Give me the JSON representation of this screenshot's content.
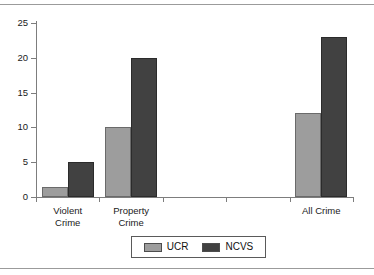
{
  "chart_data": {
    "type": "bar",
    "title": "",
    "subtitle": "",
    "xlabel": "",
    "ylabel": "",
    "ylim": [
      0,
      25
    ],
    "yticks": [
      0,
      5,
      10,
      15,
      20,
      25
    ],
    "grid": false,
    "legend_position": "bottom",
    "categories": [
      "Violent Crime",
      "Property Crime",
      "",
      "",
      "All Crime"
    ],
    "category_lines": [
      [
        "Violent",
        "Crime"
      ],
      [
        "Property",
        "Crime"
      ],
      [
        ""
      ],
      [
        ""
      ],
      [
        "All Crime"
      ]
    ],
    "series": [
      {
        "name": "UCR",
        "color": "#9d9d9d",
        "values": [
          1.5,
          10,
          null,
          null,
          12
        ]
      },
      {
        "name": "NCVS",
        "color": "#414141",
        "values": [
          5,
          20,
          null,
          null,
          23
        ]
      }
    ]
  },
  "legend": {
    "items": [
      {
        "label": "UCR",
        "swatch": "ucr-swatch"
      },
      {
        "label": "NCVS",
        "swatch": "ncvs-swatch"
      }
    ]
  },
  "axes": {
    "y_tick_labels": [
      "0",
      "5",
      "10",
      "15",
      "20",
      "25"
    ]
  }
}
